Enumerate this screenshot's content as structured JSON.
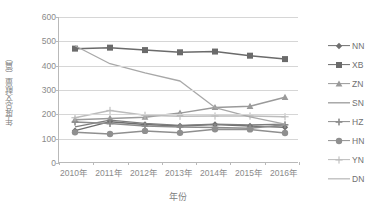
{
  "chart_data": {
    "type": "line",
    "title": "",
    "xlabel": "年份",
    "ylabel": "年度总文献量（篇）",
    "categories": [
      "2010年",
      "2011年",
      "2012年",
      "2013年",
      "2014年",
      "2015年",
      "2016年"
    ],
    "ylim": [
      0,
      600
    ],
    "ytick_labels": [
      "0",
      "100",
      "200",
      "300",
      "400",
      "500",
      "600"
    ],
    "ytick_values": [
      0,
      100,
      200,
      300,
      400,
      500,
      600
    ],
    "grid": true,
    "legend_position": "right",
    "series": [
      {
        "name": "NN",
        "marker": "diamond",
        "color": "#6f6f6f",
        "values": [
          133,
          170,
          158,
          152,
          158,
          152,
          147
        ]
      },
      {
        "name": "XB",
        "marker": "square",
        "color": "#6b6b6b",
        "values": [
          470,
          474,
          464,
          455,
          458,
          441,
          427
        ]
      },
      {
        "name": "ZN",
        "marker": "triangle",
        "color": "#9a9a9a",
        "values": [
          178,
          183,
          188,
          205,
          228,
          233,
          270
        ]
      },
      {
        "name": "SN",
        "marker": "none",
        "color": "#7d7d7d",
        "values": [
          148,
          176,
          163,
          155,
          160,
          157,
          160
        ]
      },
      {
        "name": "HZ",
        "marker": "plus",
        "color": "#8c8c8c",
        "values": [
          168,
          162,
          152,
          148,
          146,
          143,
          157
        ]
      },
      {
        "name": "HN",
        "marker": "circle",
        "color": "#8f8f8f",
        "values": [
          126,
          119,
          132,
          124,
          139,
          138,
          123
        ]
      },
      {
        "name": "YN",
        "marker": "plus-thin",
        "color": "#bcbcbc",
        "values": [
          186,
          216,
          196,
          192,
          193,
          193,
          190
        ]
      },
      {
        "name": "DN",
        "marker": "none",
        "color": "#a8a8a8",
        "values": [
          482,
          408,
          370,
          337,
          228,
          190,
          160
        ]
      }
    ]
  }
}
